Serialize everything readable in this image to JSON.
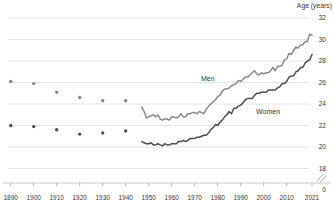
{
  "chart": {
    "axis_title": "Age (years)"
  },
  "chart_data": {
    "type": "line",
    "title": "",
    "xlabel": "",
    "ylabel": "Age (years)",
    "y_axis": {
      "position": "right",
      "ticks": [
        32,
        30,
        28,
        26,
        24,
        22,
        20,
        18
      ],
      "zero_label": "0",
      "axis_break_between": [
        18,
        0
      ],
      "range_shown": [
        18,
        32
      ],
      "grid": true
    },
    "x_axis": {
      "ticks": [
        1890,
        1900,
        1910,
        1920,
        1930,
        1940,
        1950,
        1960,
        1970,
        1980,
        1990,
        2000,
        2010,
        2021
      ],
      "range": [
        1890,
        2021
      ]
    },
    "colors": {
      "men": "#8a8a8a",
      "women": "#4f4f4f",
      "grid": "#dddddd",
      "axis": "#c4c4c4",
      "tick": "#a0a0a0",
      "text": "#3a3a3a"
    },
    "series": [
      {
        "name": "Men (decennial)",
        "display": "dots",
        "color": "#8a8a8a",
        "x": [
          1890,
          1900,
          1910,
          1920,
          1930,
          1940
        ],
        "values": [
          26.1,
          25.9,
          25.1,
          24.6,
          24.3,
          24.3
        ]
      },
      {
        "name": "Women (decennial)",
        "display": "dots",
        "color": "#4f4f4f",
        "x": [
          1890,
          1900,
          1910,
          1920,
          1930,
          1940
        ],
        "values": [
          22.0,
          21.9,
          21.6,
          21.2,
          21.3,
          21.5
        ]
      },
      {
        "name": "Men",
        "display": "line",
        "color": "#8a8a8a",
        "x_start": 1947,
        "x_step": 1,
        "values": [
          23.7,
          23.3,
          22.7,
          22.8,
          22.9,
          23.0,
          22.8,
          23.0,
          22.6,
          22.5,
          22.6,
          22.6,
          22.5,
          22.8,
          22.8,
          22.7,
          22.8,
          23.1,
          22.8,
          22.8,
          23.1,
          23.1,
          23.2,
          23.2,
          23.1,
          23.3,
          23.2,
          23.1,
          23.5,
          23.8,
          24.0,
          24.2,
          24.4,
          24.7,
          24.8,
          25.2,
          25.4,
          25.4,
          25.5,
          25.7,
          25.8,
          25.9,
          26.2,
          26.1,
          26.3,
          26.5,
          26.5,
          26.7,
          26.9,
          27.1,
          26.8,
          26.7,
          26.9,
          26.8,
          26.9,
          26.9,
          27.1,
          27.4,
          27.1,
          27.5,
          27.5,
          27.6,
          28.1,
          28.2,
          28.7,
          28.6,
          29.0,
          29.3,
          29.2,
          29.5,
          29.5,
          29.8,
          29.8,
          30.5,
          30.4
        ]
      },
      {
        "name": "Women",
        "display": "line",
        "color": "#4f4f4f",
        "x_start": 1947,
        "x_step": 1,
        "values": [
          20.5,
          20.4,
          20.3,
          20.3,
          20.4,
          20.2,
          20.2,
          20.3,
          20.2,
          20.1,
          20.3,
          20.2,
          20.2,
          20.3,
          20.3,
          20.3,
          20.5,
          20.5,
          20.6,
          20.5,
          20.6,
          20.8,
          20.8,
          20.8,
          20.9,
          20.9,
          21.0,
          21.1,
          21.1,
          21.3,
          21.6,
          21.8,
          22.1,
          22.0,
          22.3,
          22.5,
          22.8,
          23.0,
          23.3,
          23.1,
          23.6,
          23.6,
          23.8,
          23.9,
          24.1,
          24.4,
          24.5,
          24.5,
          24.5,
          24.8,
          25.0,
          25.0,
          25.1,
          25.1,
          25.1,
          25.3,
          25.3,
          25.3,
          25.3,
          25.5,
          25.6,
          25.9,
          25.9,
          26.1,
          26.5,
          26.6,
          26.6,
          27.0,
          27.1,
          27.4,
          27.4,
          27.8,
          28.0,
          28.1,
          28.6
        ]
      }
    ],
    "annotations": [
      {
        "text": "Men",
        "x_year": 1975.7,
        "y_age": 26.1
      },
      {
        "text": "Women",
        "x_year": 2001.9,
        "y_age": 23.1
      }
    ],
    "legend": "inline-labels"
  }
}
